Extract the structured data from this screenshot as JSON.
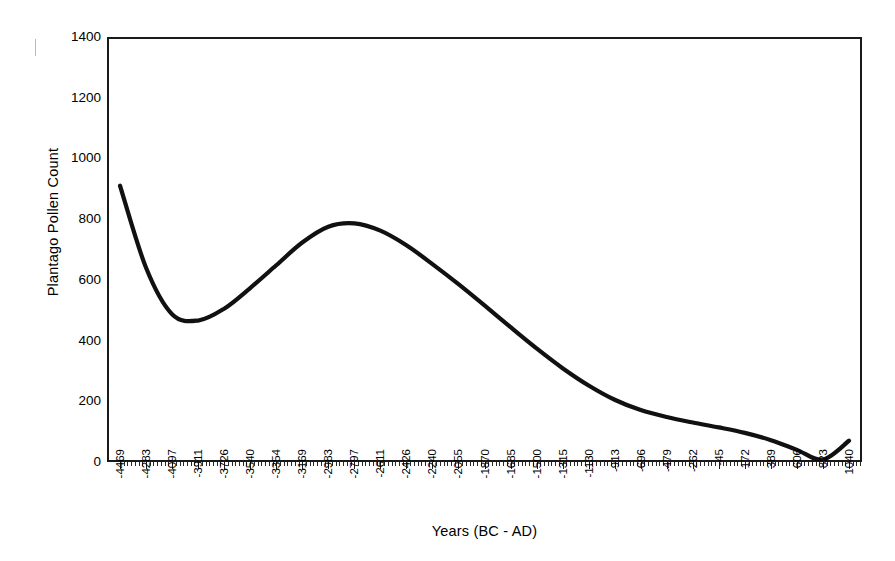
{
  "chart_data": {
    "type": "line",
    "title": "",
    "xlabel": "Years (BC - AD)",
    "ylabel": "Plantago Pollen Count",
    "ylim": [
      0,
      1400
    ],
    "y_ticks": [
      0,
      200,
      400,
      600,
      800,
      1000,
      1200,
      1400
    ],
    "grid": false,
    "legend": null,
    "categories": [
      "-4469",
      "-4283",
      "-4097",
      "-3911",
      "-3726",
      "-3540",
      "-3354",
      "-3169",
      "-2983",
      "-2797",
      "-2611",
      "-2426",
      "-2240",
      "-2055",
      "-1870",
      "-1685",
      "-1500",
      "-1315",
      "-1130",
      "-913",
      "-696",
      "-479",
      "-262",
      "-45",
      "172",
      "389",
      "606",
      "823",
      "1040"
    ],
    "series": [
      {
        "name": "Plantago Pollen Count",
        "color": "#111111",
        "values": [
          910,
          640,
          487,
          466,
          505,
          573,
          648,
          723,
          775,
          786,
          762,
          714,
          652,
          586,
          516,
          444,
          374,
          309,
          252,
          205,
          171,
          148,
          130,
          114,
          96,
          72,
          40,
          8,
          70
        ]
      }
    ],
    "annotations": {
      "start_value": 910,
      "minimum_value": 466,
      "minimum_at": "-3911",
      "peak_value": 786,
      "peak_at": "-2797",
      "end_value": 70,
      "end_at": "1040"
    }
  },
  "axes": {
    "y_title": "Plantago Pollen Count",
    "x_title": "Years (BC - AD)"
  }
}
